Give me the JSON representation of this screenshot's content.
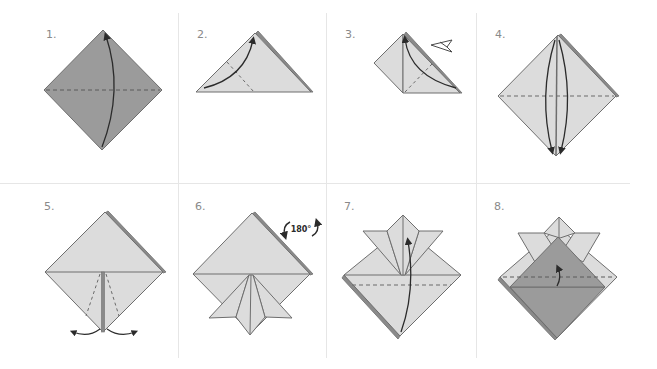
{
  "colors": {
    "background": "#ffffff",
    "grid_line": "#e6e6e6",
    "paper_dark": "#9b9b9b",
    "paper_light": "#dcdcdc",
    "paper_edge": "#6e6e6e",
    "paper_back_edge": "#7d7d7d",
    "arrow": "#2b2b2b",
    "dashed_crease": "#6a6a6a",
    "label": "#8a8a8a"
  },
  "steps": [
    {
      "number": "1.",
      "label": "1.",
      "description": "Dark-side-up square; fold bottom corner up to top along horizontal diagonal",
      "icons": [
        "fold-up-arrow-icon",
        "valley-fold-dashed-line"
      ]
    },
    {
      "number": "2.",
      "label": "2.",
      "description": "Triangle; fold left corner up to top",
      "icons": [
        "fold-arrow-icon",
        "valley-fold-dashed-line"
      ]
    },
    {
      "number": "3.",
      "label": "3.",
      "description": "Fold right corner up to top; repeat behind",
      "icons": [
        "fold-arrow-icon",
        "repeat-behind-arrow-icon",
        "valley-fold-dashed-line"
      ]
    },
    {
      "number": "4.",
      "label": "4.",
      "description": "Square base; fold top flaps down",
      "icons": [
        "fold-down-arrow-icon",
        "fold-down-arrow-icon",
        "valley-fold-dashed-line"
      ]
    },
    {
      "number": "5.",
      "label": "5.",
      "description": "Fold bottom flaps outward along dashed lines",
      "icons": [
        "fold-out-left-arrow-icon",
        "fold-out-right-arrow-icon",
        "valley-fold-dashed-line"
      ]
    },
    {
      "number": "6.",
      "label": "6.",
      "description": "Rotate model 180 degrees",
      "rotate_text": "180°",
      "icons": [
        "rotate-180-icon"
      ]
    },
    {
      "number": "7.",
      "label": "7.",
      "description": "Fold bottom corner up along dashed line",
      "icons": [
        "fold-up-arrow-icon",
        "valley-fold-dashed-line"
      ]
    },
    {
      "number": "8.",
      "label": "8.",
      "description": "Fold bottom layer up inside along dashed line",
      "icons": [
        "tuck-arrow-icon",
        "valley-fold-dashed-line"
      ]
    }
  ]
}
